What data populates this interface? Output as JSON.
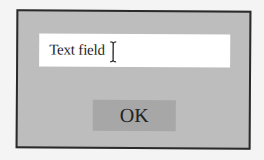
{
  "dialog": {
    "text_field": {
      "value": "Text field",
      "cursor_icon": "ibeam-cursor-icon"
    },
    "ok_button": {
      "label": "OK"
    }
  },
  "colors": {
    "background": "#f4f4f4",
    "dialog_fill": "#bdbdbd",
    "dialog_border": "#2a2a2a",
    "text_field_fill": "#ffffff",
    "button_fill": "#a7a7a7",
    "text": "#1e1e1e"
  }
}
